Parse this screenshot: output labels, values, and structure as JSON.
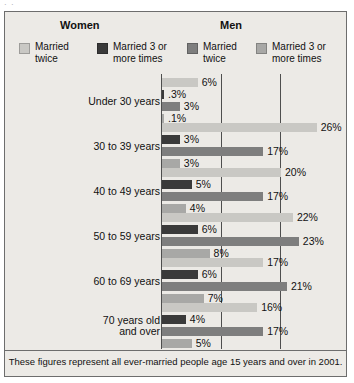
{
  "artifact_text": "·  ·",
  "figure": {
    "footnote": "These figures represent all ever-married people age 15 years and over in 2001."
  },
  "legend": {
    "groups": [
      {
        "name": "Women",
        "title": "Women"
      },
      {
        "name": "Men",
        "title": "Men"
      }
    ],
    "entries": [
      {
        "label": "Married\ntwice",
        "color": "#c9c8c4",
        "group": "Women"
      },
      {
        "label": "Married 3 or\nmore times",
        "color": "#3a3a3a",
        "group": "Women"
      },
      {
        "label": "Married\ntwice",
        "color": "#7e7e7e",
        "group": "Men"
      },
      {
        "label": "Married 3 or\nmore times",
        "color": "#a8a8a6",
        "group": "Men"
      }
    ]
  },
  "chart_data": {
    "type": "bar",
    "orientation": "horizontal",
    "title": "",
    "xlabel": "",
    "ylabel": "",
    "xlim": [
      0,
      30
    ],
    "grid": true,
    "gridlines": [
      10,
      20
    ],
    "legend_position": "top",
    "categories": [
      "Under 30 years",
      "30 to 39 years",
      "40 to 49 years",
      "50 to 59 years",
      "60 to 69 years",
      "70 years old\nand over"
    ],
    "series": [
      {
        "name": "Women - Married twice",
        "color": "#c9c8c4",
        "values": [
          6,
          26,
          20,
          22,
          17,
          16
        ],
        "labels": [
          "6%",
          "26%",
          "20%",
          "22%",
          "17%",
          "16%"
        ]
      },
      {
        "name": "Women - Married 3 or more times",
        "color": "#3a3a3a",
        "values": [
          0.3,
          3,
          5,
          6,
          6,
          4
        ],
        "labels": [
          ".3%",
          "3%",
          "5%",
          "6%",
          "6%",
          "4%"
        ]
      },
      {
        "name": "Men - Married twice",
        "color": "#7e7e7e",
        "values": [
          3,
          17,
          17,
          23,
          21,
          17
        ],
        "labels": [
          "3%",
          "17%",
          "17%",
          "23%",
          "21%",
          "17%"
        ]
      },
      {
        "name": "Men - Married 3 or more times",
        "color": "#a8a8a6",
        "values": [
          0.1,
          3,
          4,
          8,
          7,
          5
        ],
        "labels": [
          ".1%",
          "3%",
          "4%",
          "8%",
          "7%",
          "5%"
        ]
      }
    ]
  }
}
